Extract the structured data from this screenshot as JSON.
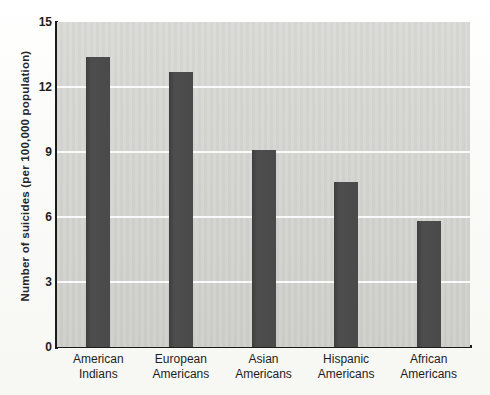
{
  "chart_data": {
    "type": "bar",
    "title": "",
    "xlabel": "",
    "ylabel": "Number of suicides (per 100,000 population)",
    "categories": [
      "American Indians",
      "European Americans",
      "Asian Americans",
      "Hispanic Americans",
      "African Americans"
    ],
    "category_lines": [
      [
        "American",
        "Indians"
      ],
      [
        "European",
        "Americans"
      ],
      [
        "Asian",
        "Americans"
      ],
      [
        "Hispanic",
        "Americans"
      ],
      [
        "African",
        "Americans"
      ]
    ],
    "values": [
      13.4,
      12.7,
      9.1,
      7.6,
      5.8
    ],
    "ylim": [
      0,
      15
    ],
    "yticks": [
      0,
      3,
      6,
      9,
      12,
      15
    ],
    "ytick_labels": [
      "0",
      "3",
      "6",
      "9",
      "12",
      "15"
    ],
    "grid": true,
    "legend": false,
    "bar_color": "#4a4a4a",
    "plot_background": "#d5d5d2",
    "gridline_color": "#ffffff",
    "axis_color": "#1b1b1b"
  }
}
